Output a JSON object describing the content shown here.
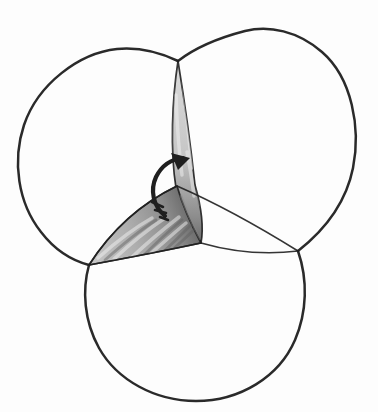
{
  "figure": {
    "colors": {
      "paper": "#fdfdfd",
      "ink": "#1f1f1f",
      "streak_light": "#f2f2f2",
      "band_streak_dark": "#8a8a8a",
      "petal_streak_dark": "#5f5f5f",
      "band_gradient": [
        "#dcdcdc",
        "#cfcfcf",
        "#c6c6c6",
        "#a8a8a8",
        "#8c8c8c",
        "#6b6b6b"
      ],
      "petal_gradient": [
        "#c6c6c6",
        "#aeaeae",
        "#8c8c8c",
        "#626262"
      ]
    },
    "paths": {
      "circle_a": "M 178 61 C 157 51 138 47 117 49 C 79 53 38 84 24 125 C 12 161 18 203 41 232 C 54 249 70 260 89 265",
      "circle_b": "M 298 251 C 326 229 346 203 353 168 C 361 128 352 78 322 52 C 298 31 269 25 245 31 C 218 38 196 47 178 61",
      "circle_c": "M 89 265 C 82 290 84 321 99 348 C 117 380 155 401 196 401 C 240 401 279 377 295 340 C 307 312 308 280 298 251",
      "inner_arc": "M 89 265 Q 123 212 177 186 Q 232 210 298 251",
      "equator_arc": "M 89 265 Q 154 253 201 243 Q 250 257 298 251",
      "band": "M 178 61 C 172 100 170 150 176 188 C 184 211 194 230 201 243 C 204 227 201 206 195 185 C 191 148 184 98 178 61 Z",
      "petal": "M 89 265 Q 123 212 177 186 C 184 211 194 230 201 243 Q 154 253 89 265 Z",
      "band_highlights": "M 183 80 C 186 110 189 140 192 168 M 176 95 C 177 125 179 152 182 175 M 187 152 C 190 167 192 181 194 196",
      "band_shadows": "M 175 70 C 172 100 171 130 172 158 M 191 120 C 194 150 197 180 199 205 M 181 196 C 187 213 194 228 199 239",
      "petal_highlights": "M 98 258 C 116 242 136 227 152 218 M 114 259 C 131 243 150 228 165 218 M 131 258 C 147 243 165 228 179 217 M 149 255 C 162 244 175 232 186 223",
      "petal_shadows": "M 105 260 C 123 244 142 229 156 220 M 140 259 C 155 244 170 230 182 220 M 160 255 C 172 244 184 232 192 224 M 170 252 C 180 243 190 234 197 227",
      "arrow_shaft": "M 165 216 C 153 206 150 190 156 177 C 162 165 172 159 183 158",
      "arrow_head": "M 190 158 L 171 153 L 178 170 Z",
      "arrow_tail_marks": "M 152 202 L 163 207 M 155 210 L 166 213 M 160 217 L 168 220"
    },
    "geometry": {
      "canvas_width": 378,
      "canvas_height": 412,
      "top_junction": [
        178,
        61
      ],
      "lower_left_junction": [
        89,
        265
      ],
      "right_junction": [
        298,
        251
      ],
      "center_point": [
        201,
        243
      ]
    }
  }
}
